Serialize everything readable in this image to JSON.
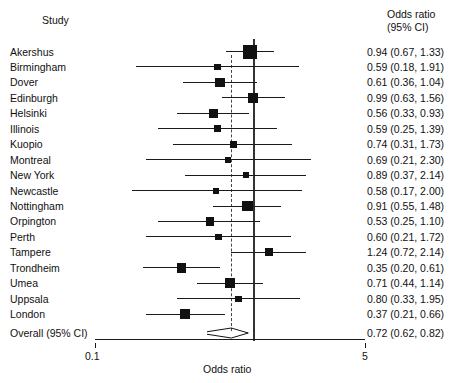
{
  "headers": {
    "study": "Study",
    "or_line1": "Odds ratio",
    "or_line2": "(95% CI)"
  },
  "axis": {
    "title": "Odds ratio",
    "tick_low": "0.1",
    "tick_high": "5"
  },
  "overall": {
    "label": "Overall (95% CI)",
    "value_text": "0.72 (0.62, 0.82)"
  },
  "colors": {
    "marker": "#111111",
    "line": "#1a1a1a",
    "null_line": "#333333",
    "summary_line": "#444444",
    "text": "#111111",
    "background": "#ffffff"
  },
  "chart_data": {
    "type": "forest",
    "title": "",
    "xlabel": "Odds ratio",
    "ylabel": "Study",
    "xscale": "log",
    "xlim": [
      0.1,
      5
    ],
    "xticks": [
      0.1,
      5
    ],
    "xticklabels": [
      "0.1",
      "5"
    ],
    "grid": false,
    "legend": false,
    "null_value": 1.0,
    "summary_reference": 0.72,
    "columns": [
      "Study",
      "Odds ratio (95% CI)"
    ],
    "categories": [
      "Akershus",
      "Birmingham",
      "Dover",
      "Edinburgh",
      "Helsinki",
      "Illinois",
      "Kuopio",
      "Montreal",
      "New York",
      "Newcastle",
      "Nottingham",
      "Orpington",
      "Perth",
      "Tampere",
      "Trondheim",
      "Umea",
      "Uppsala",
      "London"
    ],
    "values": [
      0.94,
      0.59,
      0.61,
      0.99,
      0.56,
      0.59,
      0.74,
      0.69,
      0.89,
      0.58,
      0.91,
      0.53,
      0.6,
      1.24,
      0.35,
      0.71,
      0.8,
      0.37
    ],
    "ci_low": [
      0.67,
      0.18,
      0.36,
      0.63,
      0.33,
      0.25,
      0.31,
      0.21,
      0.37,
      0.17,
      0.55,
      0.25,
      0.21,
      0.72,
      0.2,
      0.44,
      0.33,
      0.21
    ],
    "ci_high": [
      1.33,
      1.91,
      1.04,
      1.56,
      0.93,
      1.39,
      1.73,
      2.3,
      2.14,
      2.0,
      1.48,
      1.1,
      1.72,
      2.14,
      0.61,
      1.14,
      1.95,
      0.66
    ],
    "weights": [
      1.0,
      0.22,
      0.56,
      0.62,
      0.52,
      0.33,
      0.3,
      0.2,
      0.26,
      0.2,
      0.66,
      0.44,
      0.26,
      0.4,
      0.58,
      0.62,
      0.22,
      0.58
    ],
    "rows": [
      {
        "study": "Akershus",
        "or": 0.94,
        "low": 0.67,
        "high": 1.33,
        "text": "0.94 (0.67, 1.33)",
        "weight": 1.0
      },
      {
        "study": "Birmingham",
        "or": 0.59,
        "low": 0.18,
        "high": 1.91,
        "text": "0.59 (0.18, 1.91)",
        "weight": 0.22
      },
      {
        "study": "Dover",
        "or": 0.61,
        "low": 0.36,
        "high": 1.04,
        "text": "0.61 (0.36, 1.04)",
        "weight": 0.56
      },
      {
        "study": "Edinburgh",
        "or": 0.99,
        "low": 0.63,
        "high": 1.56,
        "text": "0.99 (0.63, 1.56)",
        "weight": 0.62
      },
      {
        "study": "Helsinki",
        "or": 0.56,
        "low": 0.33,
        "high": 0.93,
        "text": "0.56 (0.33, 0.93)",
        "weight": 0.52
      },
      {
        "study": "Illinois",
        "or": 0.59,
        "low": 0.25,
        "high": 1.39,
        "text": "0.59 (0.25, 1.39)",
        "weight": 0.33
      },
      {
        "study": "Kuopio",
        "or": 0.74,
        "low": 0.31,
        "high": 1.73,
        "text": "0.74 (0.31, 1.73)",
        "weight": 0.3
      },
      {
        "study": "Montreal",
        "or": 0.69,
        "low": 0.21,
        "high": 2.3,
        "text": "0.69 (0.21, 2.30)",
        "weight": 0.2
      },
      {
        "study": "New York",
        "or": 0.89,
        "low": 0.37,
        "high": 2.14,
        "text": "0.89 (0.37, 2.14)",
        "weight": 0.26
      },
      {
        "study": "Newcastle",
        "or": 0.58,
        "low": 0.17,
        "high": 2.0,
        "text": "0.58 (0.17, 2.00)",
        "weight": 0.2
      },
      {
        "study": "Nottingham",
        "or": 0.91,
        "low": 0.55,
        "high": 1.48,
        "text": "0.91 (0.55, 1.48)",
        "weight": 0.66
      },
      {
        "study": "Orpington",
        "or": 0.53,
        "low": 0.25,
        "high": 1.1,
        "text": "0.53 (0.25, 1.10)",
        "weight": 0.44
      },
      {
        "study": "Perth",
        "or": 0.6,
        "low": 0.21,
        "high": 1.72,
        "text": "0.60 (0.21, 1.72)",
        "weight": 0.26
      },
      {
        "study": "Tampere",
        "or": 1.24,
        "low": 0.72,
        "high": 2.14,
        "text": "1.24 (0.72, 2.14)",
        "weight": 0.4
      },
      {
        "study": "Trondheim",
        "or": 0.35,
        "low": 0.2,
        "high": 0.61,
        "text": "0.35 (0.20, 0.61)",
        "weight": 0.58
      },
      {
        "study": "Umea",
        "or": 0.71,
        "low": 0.44,
        "high": 1.14,
        "text": "0.71 (0.44, 1.14)",
        "weight": 0.62
      },
      {
        "study": "Uppsala",
        "or": 0.8,
        "low": 0.33,
        "high": 1.95,
        "text": "0.80 (0.33, 1.95)",
        "weight": 0.22
      },
      {
        "study": "London",
        "or": 0.37,
        "low": 0.21,
        "high": 0.66,
        "text": "0.37 (0.21, 0.66)",
        "weight": 0.58
      }
    ],
    "summary": {
      "study": "Overall (95% CI)",
      "or": 0.72,
      "low": 0.62,
      "high": 0.82,
      "text": "0.72 (0.62, 0.82)"
    }
  }
}
